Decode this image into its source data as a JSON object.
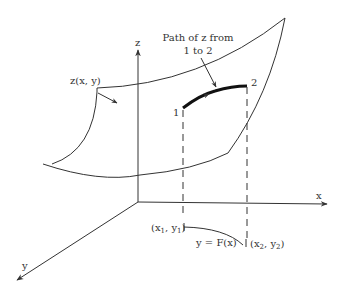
{
  "diagram": {
    "type": "3d-surface-path",
    "colors": {
      "line": "#333333",
      "background": "#ffffff"
    },
    "axes": {
      "x": {
        "label": "x"
      },
      "y": {
        "label": "y"
      },
      "z": {
        "label": "z"
      }
    },
    "surface": {
      "label": "z(x, y)"
    },
    "path_annotation": {
      "line1": "Path of z from",
      "line2": "1 to 2"
    },
    "points": {
      "start": {
        "label": "1",
        "projection": {
          "x": "x",
          "xsub": "1",
          "y": "y",
          "ysub": "1"
        }
      },
      "end": {
        "label": "2",
        "projection": {
          "x": "x",
          "xsub": "2",
          "y": "y",
          "ysub": "2"
        }
      }
    },
    "floor_curve": {
      "label": "y = F(x)"
    }
  }
}
